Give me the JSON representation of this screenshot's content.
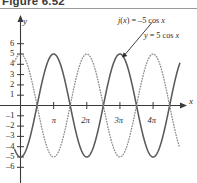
{
  "figure": {
    "caption": "Figure 6.52"
  },
  "axes": {
    "x_axis_label": "x",
    "y_axis_label": "y",
    "x_ticks": [
      {
        "value": 3.14159,
        "label": "π"
      },
      {
        "value": 6.28319,
        "label": "2π"
      },
      {
        "value": 9.42478,
        "label": "3π"
      },
      {
        "value": 12.56637,
        "label": "4π"
      }
    ],
    "x_minor_ticks": [
      1.5708,
      4.71239,
      7.85398,
      10.99557,
      14.13717
    ],
    "y_ticks": [
      {
        "value": 6,
        "label": "6"
      },
      {
        "value": 5,
        "label": "5"
      },
      {
        "value": 4,
        "label": "4"
      },
      {
        "value": 3,
        "label": "3"
      },
      {
        "value": 2,
        "label": "2"
      },
      {
        "value": 1,
        "label": "1"
      },
      {
        "value": -1,
        "label": "–1"
      },
      {
        "value": -2,
        "label": "–2"
      },
      {
        "value": -3,
        "label": "–3"
      },
      {
        "value": -4,
        "label": "–4"
      },
      {
        "value": -5,
        "label": "–5"
      },
      {
        "value": -6,
        "label": "–6"
      }
    ]
  },
  "annotations": {
    "label_j": "j(x) = –5 cos x",
    "label_y": "y = 5 cos x"
  },
  "chart_data": {
    "type": "line",
    "title": "Figure 6.52",
    "xlabel": "x",
    "ylabel": "y",
    "xlim": [
      -0.6,
      15.2
    ],
    "ylim": [
      -6.6,
      6.6
    ],
    "grid": false,
    "legend": "inline-annotations",
    "series": [
      {
        "name": "j(x) = –5 cos x",
        "expression": "-5*cos(x)",
        "amplitude": 5,
        "period": 6.28319,
        "style": "solid",
        "color": "#595959",
        "points_at_multiples_of_pi": [
          {
            "x": 0,
            "y": -5
          },
          {
            "x": 1.5708,
            "y": 0
          },
          {
            "x": 3.14159,
            "y": 5
          },
          {
            "x": 4.71239,
            "y": 0
          },
          {
            "x": 6.28319,
            "y": -5
          },
          {
            "x": 7.85398,
            "y": 0
          },
          {
            "x": 9.42478,
            "y": 5
          },
          {
            "x": 10.99557,
            "y": 0
          },
          {
            "x": 12.56637,
            "y": -5
          },
          {
            "x": 14.13717,
            "y": 0
          }
        ]
      },
      {
        "name": "y = 5 cos x",
        "expression": "5*cos(x)",
        "amplitude": 5,
        "period": 6.28319,
        "style": "dotted",
        "color": "#8c8c8c",
        "points_at_multiples_of_pi": [
          {
            "x": 0,
            "y": 5
          },
          {
            "x": 1.5708,
            "y": 0
          },
          {
            "x": 3.14159,
            "y": -5
          },
          {
            "x": 4.71239,
            "y": 0
          },
          {
            "x": 6.28319,
            "y": 5
          },
          {
            "x": 7.85398,
            "y": 0
          },
          {
            "x": 9.42478,
            "y": -5
          },
          {
            "x": 10.99557,
            "y": 0
          },
          {
            "x": 12.56637,
            "y": 5
          },
          {
            "x": 14.13717,
            "y": 0
          }
        ]
      }
    ],
    "annotation_arrow": {
      "text": "j(x) = –5 cos x",
      "points_to": {
        "x": 9.42478,
        "y": 5
      }
    }
  },
  "colors": {
    "solid_curve": "#595959",
    "dotted_curve": "#8c8c8c",
    "axis": "#3a3a3a",
    "text": "#2b2b2b"
  }
}
